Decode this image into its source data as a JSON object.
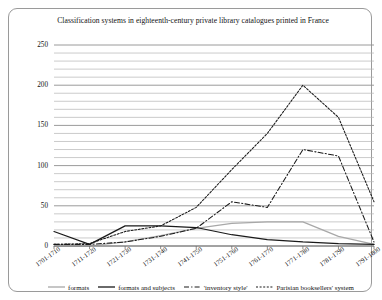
{
  "chart_data": {
    "type": "line",
    "title": "Classification systems in eighteenth-century private library catalogues printed in France",
    "xlabel": "",
    "ylabel": "",
    "categories": [
      "1701-1710",
      "1711-1720",
      "1721-1730",
      "1731-1740",
      "1741-1750",
      "1751-1760",
      "1761-1770",
      "1771-1780",
      "1781-1790",
      "1791-1800"
    ],
    "ylim": [
      0,
      250
    ],
    "yticks": [
      0,
      50,
      100,
      150,
      200,
      250
    ],
    "minor_gridline_step": 10,
    "grid": true,
    "legend_position": "bottom",
    "series": [
      {
        "name": "formats",
        "style": "solid",
        "color": "#a8a8a8",
        "values": [
          0,
          0,
          5,
          13,
          22,
          28,
          30,
          30,
          12,
          2
        ]
      },
      {
        "name": "formats and subjects",
        "style": "solid",
        "color": "#1a1a1a",
        "values": [
          18,
          2,
          25,
          25,
          23,
          14,
          8,
          5,
          3,
          2
        ]
      },
      {
        "name": "'inventory style'",
        "style": "dash-dot",
        "color": "#1a1a1a",
        "values": [
          2,
          2,
          5,
          12,
          22,
          55,
          48,
          120,
          112,
          5
        ]
      },
      {
        "name": "Parisian booksellers' system",
        "style": "dashed",
        "color": "#1a1a1a",
        "values": [
          2,
          3,
          18,
          25,
          48,
          95,
          140,
          200,
          160,
          55
        ]
      }
    ]
  },
  "legend": {
    "items": [
      {
        "label": "formats"
      },
      {
        "label": "formats and subjects"
      },
      {
        "label": "'inventory style'"
      },
      {
        "label": "Parisian booksellers' system"
      }
    ]
  }
}
